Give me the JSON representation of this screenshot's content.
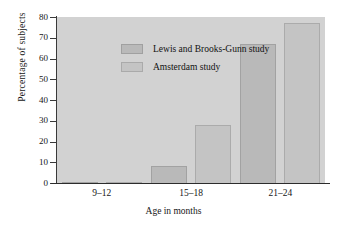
{
  "chart_data": {
    "type": "bar",
    "title": "",
    "xlabel": "Age in months",
    "ylabel": "Percentage of subjects",
    "categories": [
      "9–12",
      "15–18",
      "21–24"
    ],
    "series": [
      {
        "name": "Lewis and Brooks-Gunn study",
        "color": "#b9b9b9",
        "values": [
          0.5,
          8,
          67
        ]
      },
      {
        "name": "Amsterdam study",
        "color": "#c4c4c4",
        "values": [
          0.5,
          28,
          77
        ]
      }
    ],
    "ylim": [
      0,
      80
    ],
    "yticks": [
      0,
      10,
      20,
      30,
      40,
      50,
      60,
      70,
      80
    ],
    "ytick_labels": [
      "0",
      "10",
      "20",
      "30",
      "40",
      "50",
      "60",
      "70",
      "80"
    ],
    "grid": false,
    "legend_position": "top-left",
    "plot_background": "#d2d2d2",
    "figure_background": "#ffffff",
    "axis_color": "#2c2c2c"
  }
}
